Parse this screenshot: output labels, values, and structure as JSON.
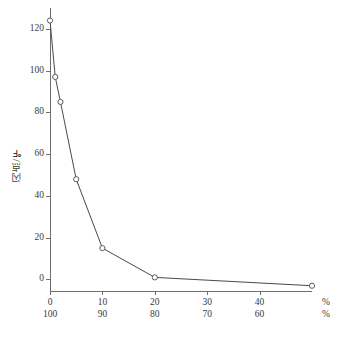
{
  "chart_data": {
    "type": "line",
    "title": "",
    "xlabel_primary": "汽油",
    "xlabel_secondary": "煤油",
    "unit_symbol": "%",
    "ylabel": "闪点/℉",
    "x": [
      0,
      1,
      2,
      5,
      10,
      20,
      50
    ],
    "values": [
      124,
      97,
      85,
      48,
      15,
      1,
      -3
    ],
    "series": [
      {
        "name": "闪点",
        "points": [
          {
            "x": 0,
            "y": 124
          },
          {
            "x": 1,
            "y": 97
          },
          {
            "x": 2,
            "y": 85
          },
          {
            "x": 5,
            "y": 48
          },
          {
            "x": 10,
            "y": 15
          },
          {
            "x": 20,
            "y": 1
          },
          {
            "x": 50,
            "y": -3
          }
        ]
      }
    ],
    "xlim": [
      0,
      50
    ],
    "ylim": [
      -6,
      130
    ],
    "xticks": [
      0,
      10,
      20,
      30,
      40
    ],
    "xticklabels_top": [
      "0",
      "10",
      "20",
      "30",
      "40"
    ],
    "xticklabels_bottom": [
      "100",
      "90",
      "80",
      "70",
      "60"
    ],
    "yticks": [
      0,
      20,
      40,
      60,
      80,
      100,
      120
    ],
    "yticklabels": [
      "0",
      "20",
      "40",
      "60",
      "80",
      "100",
      "120"
    ],
    "grid": false,
    "legend": "none",
    "marker_style": "open-circle",
    "line_color": "#4a4a4a",
    "marker_fill": "#ffffff",
    "axis_color": "#6e6e6e"
  },
  "caption": ""
}
